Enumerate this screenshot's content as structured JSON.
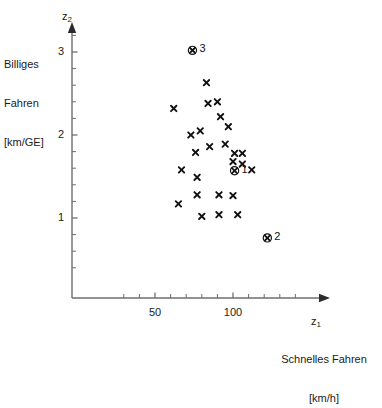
{
  "figure": {
    "background": "#ffffff",
    "ink": "#1a1a1a",
    "axis_color": "#6e6e6e",
    "marker_color": "#111111"
  },
  "axes": {
    "y": {
      "variable": "z",
      "variable_sub": "2",
      "caption_lines": [
        "Billiges",
        "Fahren",
        "[km/GE]"
      ],
      "tick_labels": [
        "3",
        "2",
        "1"
      ],
      "tick_values": [
        3,
        2,
        1
      ]
    },
    "x": {
      "variable": "z",
      "variable_sub": "1",
      "caption_lines": [
        "Schnelles Fahren",
        "[km/h]"
      ],
      "tick_labels": [
        "50",
        "100"
      ],
      "tick_values": [
        50,
        100
      ]
    }
  },
  "chart_data": {
    "type": "scatter",
    "title": "",
    "xlabel": "Schnelles Fahren [km/h]",
    "ylabel": "Billiges Fahren [km/GE]",
    "xlim": [
      20,
      150
    ],
    "ylim": [
      0.18,
      3.45
    ],
    "xticks": [
      50,
      100
    ],
    "yticks": [
      1,
      2,
      3
    ],
    "x_minor_step": 10,
    "y_minor_step": 0.2,
    "grid": false,
    "legend": null,
    "series": [
      {
        "name": "Beobachtungen",
        "marker": "x",
        "points": [
          {
            "x": 83,
            "y": 2.63
          },
          {
            "x": 84,
            "y": 2.38
          },
          {
            "x": 90,
            "y": 2.4
          },
          {
            "x": 62,
            "y": 2.32
          },
          {
            "x": 92,
            "y": 2.22
          },
          {
            "x": 97,
            "y": 2.1
          },
          {
            "x": 79,
            "y": 2.05
          },
          {
            "x": 73,
            "y": 2.0
          },
          {
            "x": 95,
            "y": 1.89
          },
          {
            "x": 85,
            "y": 1.86
          },
          {
            "x": 76,
            "y": 1.79
          },
          {
            "x": 101,
            "y": 1.78
          },
          {
            "x": 106,
            "y": 1.78
          },
          {
            "x": 100,
            "y": 1.68
          },
          {
            "x": 106,
            "y": 1.65
          },
          {
            "x": 112,
            "y": 1.58
          },
          {
            "x": 67,
            "y": 1.58
          },
          {
            "x": 77,
            "y": 1.49
          },
          {
            "x": 77,
            "y": 1.28
          },
          {
            "x": 91,
            "y": 1.28
          },
          {
            "x": 100,
            "y": 1.27
          },
          {
            "x": 65,
            "y": 1.17
          },
          {
            "x": 80,
            "y": 1.02
          },
          {
            "x": 91,
            "y": 1.04
          },
          {
            "x": 103,
            "y": 1.04
          }
        ]
      }
    ],
    "highlighted_points": [
      {
        "label": "3",
        "x": 74,
        "y": 3.02,
        "marker": "circled-x"
      },
      {
        "label": "1",
        "x": 101,
        "y": 1.57,
        "marker": "circled-x"
      },
      {
        "label": "2",
        "x": 122,
        "y": 0.76,
        "marker": "circled-x"
      }
    ]
  }
}
